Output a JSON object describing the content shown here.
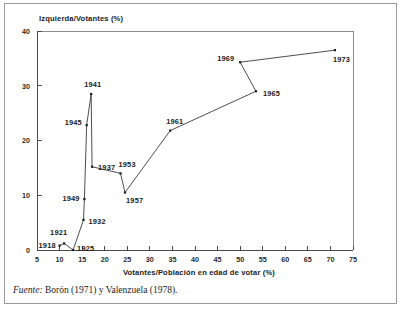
{
  "figure": {
    "source_label": "Fuente:",
    "source_text": "Borón (1971) y Valenzuela (1978)."
  },
  "chart_data": {
    "type": "line",
    "title": "",
    "xlabel": "Votantes/Población en edad de votar (%)",
    "ylabel": "Izquierda/Votantes (%)",
    "xlim": [
      5,
      75
    ],
    "ylim": [
      0,
      40
    ],
    "xticks": [
      5,
      10,
      15,
      20,
      25,
      30,
      35,
      40,
      45,
      50,
      55,
      60,
      65,
      70,
      75
    ],
    "yticks": [
      0,
      10,
      20,
      30,
      40
    ],
    "grid": false,
    "legend": "none",
    "marker": "point",
    "line_color": "#3a3a3a",
    "marker_color": "#1c1c1c",
    "series": [
      {
        "name": "Chile",
        "points": [
          {
            "label": "1918",
            "x": 10.0,
            "y": 0.8,
            "label_dx": -21,
            "label_dy": 2
          },
          {
            "label": "1921",
            "x": 11.0,
            "y": 1.2,
            "label_dx": -14,
            "label_dy": -8
          },
          {
            "label": "1925",
            "x": 13.0,
            "y": 0.0,
            "label_dx": 4,
            "label_dy": 1
          },
          {
            "label": "1932",
            "x": 15.3,
            "y": 5.5,
            "label_dx": 5,
            "label_dy": 4
          },
          {
            "label": "1949",
            "x": 15.5,
            "y": 9.3,
            "label_dx": -22,
            "label_dy": 2
          },
          {
            "label": "1945",
            "x": 16.0,
            "y": 22.8,
            "label_dx": -22,
            "label_dy": 0
          },
          {
            "label": "1941",
            "x": 17.0,
            "y": 28.5,
            "label_dx": -7,
            "label_dy": -7
          },
          {
            "label": "1937",
            "x": 17.2,
            "y": 15.2,
            "label_dx": 6,
            "label_dy": 3
          },
          {
            "label": "1953",
            "x": 23.5,
            "y": 14.0,
            "label_dx": -2,
            "label_dy": -6
          },
          {
            "label": "1957",
            "x": 24.5,
            "y": 10.5,
            "label_dx": 1,
            "label_dy": 10
          },
          {
            "label": "1961",
            "x": 34.5,
            "y": 21.8,
            "label_dx": -4,
            "label_dy": -7
          },
          {
            "label": "1965",
            "x": 53.5,
            "y": 29.0,
            "label_dx": 7,
            "label_dy": 5
          },
          {
            "label": "1969",
            "x": 50.0,
            "y": 34.3,
            "label_dx": -23,
            "label_dy": -1
          },
          {
            "label": "1973",
            "x": 71.0,
            "y": 36.5,
            "label_dx": -2,
            "label_dy": 12
          }
        ]
      }
    ]
  }
}
